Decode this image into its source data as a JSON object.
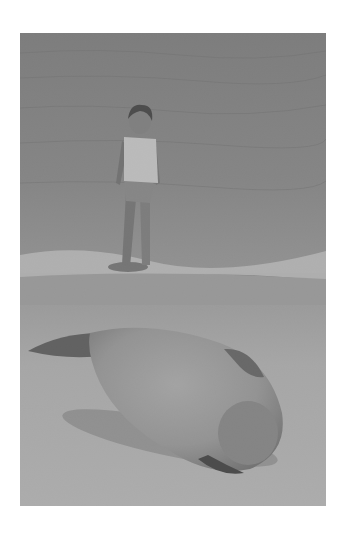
{
  "image": {
    "description": "Grayscale photograph of a young girl standing at the water's edge on a beach, with a monk seal resting on the sand in the foreground",
    "palette": {
      "water_dark": "#6f6f6f",
      "water_mid": "#858585",
      "surf_light": "#c9c9c9",
      "wet_sand": "#a9a9a9",
      "dry_sand": "#bdbdbd",
      "seal_body": "#9a9a9a",
      "seal_shadow": "#3a3a3a",
      "background": "#ffffff"
    },
    "subjects": [
      {
        "name": "girl",
        "label": "Girl standing in shallow surf"
      },
      {
        "name": "seal",
        "label": "Seal lying on sand"
      }
    ]
  }
}
